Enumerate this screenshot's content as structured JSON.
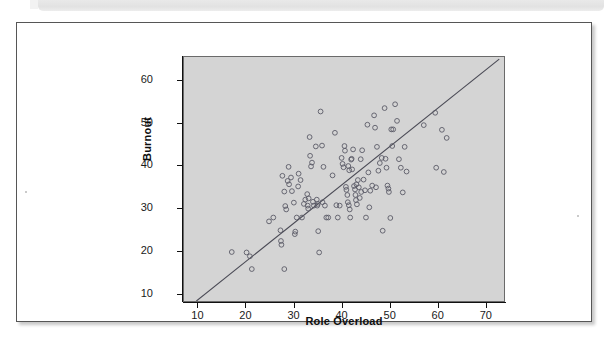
{
  "figure": {
    "kind": "scatterplot-with-fit-line",
    "colors": {
      "plot_background": "#d4d4d4",
      "page_background": "#ffffff",
      "axis": "#111111",
      "point_stroke": "#5a5a66",
      "fit_line": "#4a4a55",
      "card_border": "#565656",
      "band": "#e6e6e6"
    }
  },
  "chart_data": {
    "type": "scatter",
    "title": "",
    "subtitle": "",
    "xlabel": "Role Overload",
    "ylabel": "Burnout",
    "xlim": [
      7,
      74
    ],
    "ylim": [
      8.2,
      65.5
    ],
    "xticks": [
      10,
      20,
      30,
      40,
      50,
      60,
      70
    ],
    "yticks": [
      10,
      20,
      30,
      40,
      50,
      60
    ],
    "xtick_labels": [
      "10",
      "20",
      "30",
      "40",
      "50",
      "60",
      "70"
    ],
    "ytick_labels": [
      "10",
      "20",
      "30",
      "40",
      "50",
      "60"
    ],
    "grid": false,
    "legend": "none",
    "marker": "open-circle",
    "series": [
      {
        "name": "Respondents",
        "n": 126,
        "points": [
          [
            17.0,
            19.7
          ],
          [
            20.1,
            19.6
          ],
          [
            20.8,
            18.7
          ],
          [
            21.2,
            15.7
          ],
          [
            24.8,
            26.9
          ],
          [
            25.7,
            27.8
          ],
          [
            27.3,
            22.3
          ],
          [
            27.4,
            21.4
          ],
          [
            27.2,
            24.8
          ],
          [
            27.6,
            37.6
          ],
          [
            28.0,
            33.9
          ],
          [
            28.2,
            30.5
          ],
          [
            28.4,
            29.7
          ],
          [
            28.0,
            15.7
          ],
          [
            28.7,
            36.4
          ],
          [
            28.9,
            39.7
          ],
          [
            29.0,
            35.6
          ],
          [
            29.4,
            37.2
          ],
          [
            29.6,
            34.0
          ],
          [
            30.2,
            23.9
          ],
          [
            30.3,
            24.5
          ],
          [
            30.6,
            27.8
          ],
          [
            30.9,
            35.1
          ],
          [
            31.0,
            38.1
          ],
          [
            31.4,
            36.6
          ],
          [
            31.7,
            27.8
          ],
          [
            32.1,
            31.0
          ],
          [
            32.4,
            32.0
          ],
          [
            32.8,
            33.3
          ],
          [
            32.9,
            30.6
          ],
          [
            33.1,
            32.3
          ],
          [
            33.3,
            46.7
          ],
          [
            33.4,
            42.3
          ],
          [
            33.6,
            39.8
          ],
          [
            33.8,
            40.7
          ],
          [
            34.0,
            31.5
          ],
          [
            34.2,
            30.6
          ],
          [
            34.6,
            44.5
          ],
          [
            34.8,
            32.0
          ],
          [
            34.9,
            30.6
          ],
          [
            35.1,
            24.6
          ],
          [
            35.3,
            19.6
          ],
          [
            35.6,
            52.7
          ],
          [
            35.9,
            44.7
          ],
          [
            36.2,
            39.7
          ],
          [
            36.5,
            30.6
          ],
          [
            36.8,
            27.8
          ],
          [
            37.2,
            27.8
          ],
          [
            38.1,
            37.7
          ],
          [
            38.6,
            47.7
          ],
          [
            38.9,
            30.7
          ],
          [
            39.2,
            27.8
          ],
          [
            39.6,
            30.6
          ],
          [
            40.0,
            41.8
          ],
          [
            40.2,
            40.4
          ],
          [
            40.4,
            39.6
          ],
          [
            40.6,
            44.6
          ],
          [
            40.7,
            43.5
          ],
          [
            40.9,
            35.0
          ],
          [
            41.0,
            34.3
          ],
          [
            41.2,
            33.1
          ],
          [
            41.3,
            31.4
          ],
          [
            41.5,
            30.7
          ],
          [
            41.7,
            29.7
          ],
          [
            41.8,
            27.8
          ],
          [
            42.0,
            41.4
          ],
          [
            42.1,
            41.6
          ],
          [
            42.4,
            43.8
          ],
          [
            42.6,
            35.2
          ],
          [
            42.8,
            34.4
          ],
          [
            42.9,
            33.1
          ],
          [
            43.0,
            31.9
          ],
          [
            43.2,
            30.9
          ],
          [
            43.4,
            36.6
          ],
          [
            43.6,
            34.9
          ],
          [
            43.8,
            32.4
          ],
          [
            44.0,
            41.5
          ],
          [
            44.3,
            43.6
          ],
          [
            44.6,
            36.7
          ],
          [
            44.9,
            34.2
          ],
          [
            45.1,
            27.8
          ],
          [
            45.4,
            49.6
          ],
          [
            45.6,
            38.4
          ],
          [
            46.0,
            34.1
          ],
          [
            46.4,
            35.3
          ],
          [
            46.8,
            51.8
          ],
          [
            47.0,
            48.9
          ],
          [
            47.4,
            44.4
          ],
          [
            47.7,
            38.8
          ],
          [
            48.0,
            40.6
          ],
          [
            48.6,
            24.7
          ],
          [
            49.0,
            53.5
          ],
          [
            49.2,
            41.6
          ],
          [
            49.4,
            39.5
          ],
          [
            49.6,
            35.3
          ],
          [
            49.8,
            34.6
          ],
          [
            49.9,
            33.8
          ],
          [
            50.2,
            27.7
          ],
          [
            50.4,
            48.5
          ],
          [
            50.8,
            48.5
          ],
          [
            51.2,
            54.4
          ],
          [
            51.6,
            50.5
          ],
          [
            52.0,
            41.5
          ],
          [
            52.4,
            39.5
          ],
          [
            52.8,
            33.7
          ],
          [
            53.2,
            44.4
          ],
          [
            53.6,
            38.6
          ],
          [
            57.2,
            49.5
          ],
          [
            59.6,
            52.4
          ],
          [
            59.8,
            39.5
          ],
          [
            61.0,
            48.4
          ],
          [
            61.4,
            38.5
          ],
          [
            62.0,
            46.5
          ],
          [
            30.0,
            31.3
          ],
          [
            33.0,
            29.9
          ],
          [
            35.0,
            31.0
          ],
          [
            36.0,
            31.4
          ],
          [
            41.4,
            39.9
          ],
          [
            41.6,
            38.9
          ],
          [
            42.2,
            39.1
          ],
          [
            43.1,
            35.6
          ],
          [
            44.1,
            33.8
          ],
          [
            45.8,
            30.2
          ],
          [
            47.2,
            34.9
          ],
          [
            48.4,
            41.8
          ],
          [
            50.6,
            44.6
          ]
        ]
      }
    ],
    "fit_line": {
      "name": "Least-squares regression line",
      "x_start": 9.6,
      "y_start": 8.2,
      "x_end": 73.0,
      "y_end": 65.0,
      "slope": 0.896,
      "intercept": -0.4
    }
  }
}
